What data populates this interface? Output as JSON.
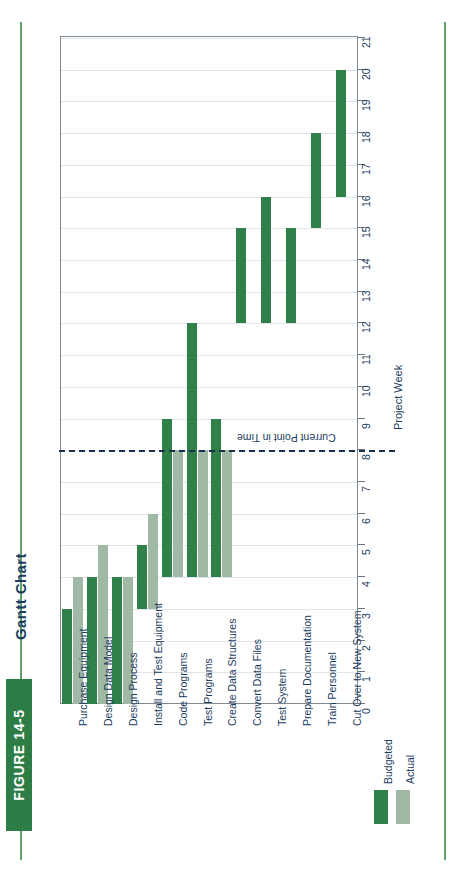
{
  "figure": {
    "banner_label": "FIGURE 14-5",
    "title": "Gantt Chart"
  },
  "axis": {
    "title": "Project Week",
    "ticks": [
      "0",
      "1",
      "2",
      "3",
      "4",
      "5",
      "6",
      "7",
      "8",
      "9",
      "10",
      "11",
      "12",
      "13",
      "14",
      "15",
      "16",
      "17",
      "18",
      "19",
      "20",
      "21"
    ]
  },
  "annotation": {
    "now_label": "Current Point in Time",
    "now_week": 8
  },
  "legend": {
    "items": [
      {
        "label": "Budgeted",
        "color": "#2f8049"
      },
      {
        "label": "Actual",
        "color": "#9fb9a4"
      }
    ]
  },
  "colors": {
    "budgeted": "#2f8049",
    "actual": "#9fb9a4",
    "banner": "#2e7d46",
    "text": "#1b3c5e",
    "grid": "#dfe5ea",
    "now": "#18304c"
  },
  "chart_data": {
    "type": "bar",
    "title": "Gantt Chart",
    "xlabel": "",
    "ylabel": "Project Week",
    "ylim": [
      0,
      21
    ],
    "grid": true,
    "legend_position": "bottom-right",
    "orientation": "horizontal-gantt",
    "categories": [
      "Purchase Equipment",
      "Design Data Model",
      "Design Process",
      "Install and Test Equipment",
      "Code Programs",
      "Test Programs",
      "Create Data Structures",
      "Convert Data Files",
      "Test System",
      "Prepare Documentation",
      "Train Personnel",
      "Cut Over to New System"
    ],
    "series": [
      {
        "name": "Budgeted",
        "bars": [
          {
            "task": "Purchase Equipment",
            "start": 0,
            "end": 3
          },
          {
            "task": "Design Data Model",
            "start": 0,
            "end": 4
          },
          {
            "task": "Design Process",
            "start": 0,
            "end": 4
          },
          {
            "task": "Install and Test Equipment",
            "start": 3,
            "end": 5
          },
          {
            "task": "Code Programs",
            "start": 4,
            "end": 9
          },
          {
            "task": "Test Programs",
            "start": 4,
            "end": 12
          },
          {
            "task": "Create Data Structures",
            "start": 4,
            "end": 9
          },
          {
            "task": "Convert Data Files",
            "start": 12,
            "end": 15
          },
          {
            "task": "Test System",
            "start": 12,
            "end": 16
          },
          {
            "task": "Prepare Documentation",
            "start": 12,
            "end": 15
          },
          {
            "task": "Train Personnel",
            "start": 15,
            "end": 18
          },
          {
            "task": "Cut Over to New System",
            "start": 16,
            "end": 20
          }
        ]
      },
      {
        "name": "Actual",
        "bars": [
          {
            "task": "Purchase Equipment",
            "start": 0,
            "end": 4
          },
          {
            "task": "Design Data Model",
            "start": 0,
            "end": 5
          },
          {
            "task": "Design Process",
            "start": 0,
            "end": 4
          },
          {
            "task": "Install and Test Equipment",
            "start": 3,
            "end": 6
          },
          {
            "task": "Code Programs",
            "start": 4,
            "end": 8
          },
          {
            "task": "Test Programs",
            "start": 4,
            "end": 8
          },
          {
            "task": "Create Data Structures",
            "start": 4,
            "end": 8
          }
        ]
      }
    ],
    "annotations": [
      {
        "label": "Current Point in Time",
        "week": 8,
        "style": "dashed-line"
      }
    ]
  }
}
